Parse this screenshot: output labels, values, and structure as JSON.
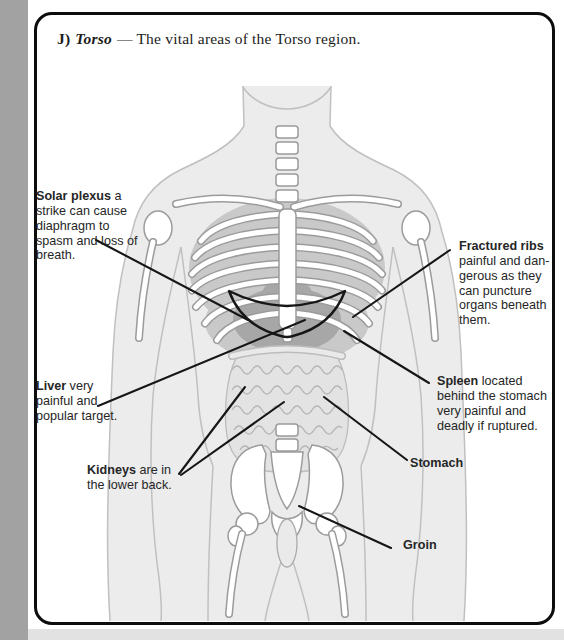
{
  "title": {
    "index": "J)",
    "term": "Torso",
    "rest": "— The vital areas of the Torso region."
  },
  "labels": {
    "solar_plexus": {
      "term": "Solar plexus",
      "body": " a\nstrike can cause\ndiaphragm to\nspasm and loss of\nbreath."
    },
    "fractured_ribs": {
      "term": "Fractured ribs",
      "body": "\npainful and dan-\ngerous as they\ncan puncture\norgans beneath\nthem."
    },
    "liver": {
      "term": "Liver",
      "body": " very\npainful and\npopular target."
    },
    "spleen": {
      "term": "Spleen",
      "body": " located\nbehind the stomach\nvery painful and\ndeadly if ruptured."
    },
    "kidneys": {
      "term": "Kidneys",
      "body": " are in\nthe lower back."
    },
    "stomach": {
      "term": "Stomach",
      "body": ""
    },
    "groin": {
      "term": "Groin",
      "body": ""
    }
  },
  "colors": {
    "card_border": "#0d0d0d",
    "left_strip": "#a2a2a2",
    "bottom_strip": "#e2e2e2",
    "annotation_ink": "#161616",
    "label_text": "#262626"
  }
}
